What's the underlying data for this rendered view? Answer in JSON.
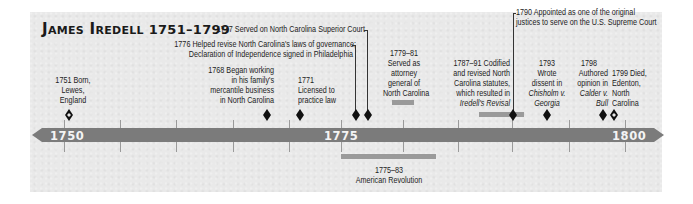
{
  "title": {
    "name": "James Iredell",
    "years": "1751–1799"
  },
  "axis": {
    "start_label": "1750",
    "mid_label": "1775",
    "end_label": "1800",
    "bar_color": "#7b7b7b"
  },
  "events": [
    {
      "id": "born",
      "year": "1751",
      "lines": [
        "1751 Born,",
        "Lewes,",
        "England"
      ],
      "marker": "open-diamond"
    },
    {
      "id": "mercantile",
      "year": "1768",
      "lines": [
        "1768 Began working",
        "in his family's",
        "mercantile business",
        "in North Carolina"
      ],
      "marker": "diamond"
    },
    {
      "id": "licensed",
      "year": "1771",
      "lines": [
        "1771",
        "Licensed to",
        "practice law"
      ],
      "marker": "diamond"
    },
    {
      "id": "revise-laws",
      "year": "1776",
      "lines": [
        "1776 Helped revise North Carolina's laws of governance;",
        "Declaration of Independence signed in Philadelphia"
      ],
      "marker": "diamond"
    },
    {
      "id": "superior-court",
      "year": "1777",
      "lines": [
        "1777 Served on North Carolina Superior Court"
      ],
      "marker": "diamond"
    },
    {
      "id": "attorney-general",
      "year": "1779–81",
      "lines": [
        "1779–81",
        "Served as",
        "attorney",
        "general of",
        "North Carolina"
      ],
      "marker": "span"
    },
    {
      "id": "codified",
      "year": "1787–91",
      "lines": [
        "1787–91 Codified",
        "and revised North",
        "Carolina statutes,",
        "which resulted in"
      ],
      "italic_line": "Iredell's Revisal",
      "marker": "span"
    },
    {
      "id": "supreme-court",
      "year": "1790",
      "lines": [
        "1790 Appointed as one of the original",
        "justices to serve on the U.S. Supreme Court"
      ],
      "marker": "diamond"
    },
    {
      "id": "chisholm",
      "year": "1793",
      "lines": [
        "1793",
        "Wrote",
        "dissent in"
      ],
      "italic_lines": [
        "Chisholm v.",
        "Georgia"
      ],
      "marker": "diamond"
    },
    {
      "id": "calder",
      "year": "1798",
      "lines": [
        "1798",
        "Authored",
        "opinion in"
      ],
      "italic_lines": [
        "Calder v.",
        "Bull"
      ],
      "marker": "diamond"
    },
    {
      "id": "died",
      "year": "1799",
      "lines": [
        "1799 Died,",
        "Edenton,",
        "North",
        "Carolina"
      ],
      "marker": "open-diamond"
    }
  ],
  "context": {
    "revolution": {
      "lines": [
        "1775–83",
        "American Revolution"
      ]
    }
  }
}
